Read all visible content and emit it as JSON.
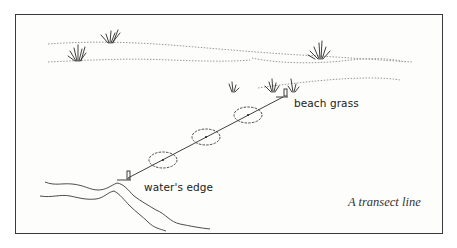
{
  "figure": {
    "caption": "A transect line",
    "labels": {
      "end_label": "beach grass",
      "start_label": "water's edge"
    },
    "elements": {
      "quadrat_count": 3,
      "stakes": 2,
      "grass_clumps": 6
    },
    "colors": {
      "ink": "#3a3a3a",
      "stipple": "#9a9a9a",
      "background": "#fdfdfb"
    }
  }
}
